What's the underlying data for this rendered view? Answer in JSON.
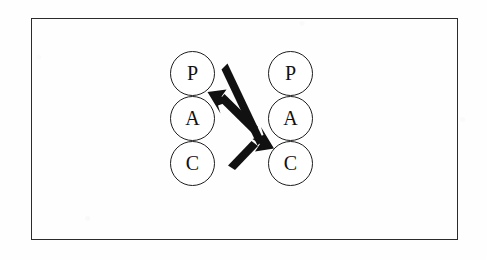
{
  "figure": {
    "kind": "transactional-analysis-diagram",
    "title": "",
    "caption": "",
    "frame": {
      "border_color": "#2b2b2b",
      "background_color": "#fefefe"
    },
    "ink_color": "#1d1d1d",
    "ego_state_legend": {
      "P": "P",
      "A": "A",
      "C": "C"
    },
    "columns": [
      {
        "name": "left-person",
        "nodes": [
          {
            "label": "P"
          },
          {
            "label": "A"
          },
          {
            "label": "C"
          }
        ]
      },
      {
        "name": "right-person",
        "nodes": [
          {
            "label": "P"
          },
          {
            "label": "A"
          },
          {
            "label": "C"
          }
        ]
      }
    ],
    "arrows": [
      {
        "name": "arrow-right-adult-to-left-parent",
        "direction": "up-left",
        "from": "right-A",
        "to": "left-P"
      },
      {
        "name": "arrow-left-parent-to-right-child",
        "direction": "down-right",
        "from": "left-A",
        "to": "right-C"
      }
    ]
  }
}
